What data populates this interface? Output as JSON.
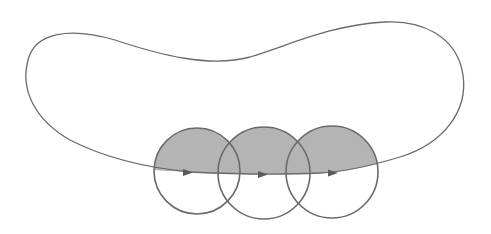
{
  "diagram": {
    "colors": {
      "stroke": "#6a6a6a",
      "shade": "#b4b4b4",
      "background": "#ffffff"
    },
    "circles": [
      {
        "id": "circle-1",
        "cx": 197,
        "cy": 171,
        "r": 43
      },
      {
        "id": "circle-2",
        "cx": 264,
        "cy": 173,
        "r": 46
      },
      {
        "id": "circle-3",
        "cx": 332,
        "cy": 172,
        "r": 46
      }
    ],
    "arrows": [
      {
        "id": "arrow-1",
        "x": 190,
        "y": 173,
        "direction": "right"
      },
      {
        "id": "arrow-2",
        "x": 266,
        "y": 175,
        "direction": "right"
      },
      {
        "id": "arrow-3",
        "x": 335,
        "y": 173,
        "direction": "right"
      }
    ]
  }
}
